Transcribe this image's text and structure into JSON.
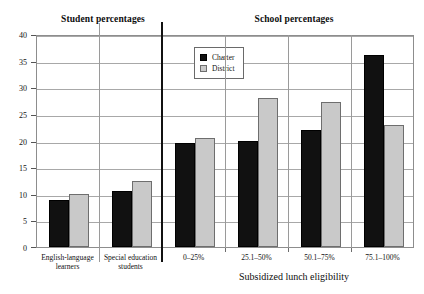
{
  "sections": {
    "student": "Student percentages",
    "school": "School percentages"
  },
  "legend": {
    "charter": "Charter",
    "district": "District"
  },
  "colors": {
    "charter": "#111111",
    "district": "#c9c9c9",
    "grid": "#a8a8a8",
    "frame": "#8d8d8d",
    "divider": "#111111",
    "background": "#ffffff"
  },
  "chart_data": {
    "type": "bar",
    "title": "",
    "subtitle": "",
    "xlabel": "Subsidized lunch eligibility",
    "ylabel": "",
    "ylim": [
      0,
      40
    ],
    "yticks": [
      0,
      5,
      10,
      15,
      20,
      25,
      30,
      35,
      40
    ],
    "ytick_labels": [
      "0",
      "5",
      "10",
      "15",
      "20",
      "25",
      "30",
      "35",
      "40"
    ],
    "grid": true,
    "legend_position": "top-center",
    "categories": [
      "English-language learners",
      "Special education students",
      "0–25%",
      "25.1–50%",
      "50.1–75%",
      "75.1–100%"
    ],
    "category_lines": [
      [
        "English-language",
        "learners"
      ],
      [
        "Special education",
        "students"
      ],
      [
        "0–25%"
      ],
      [
        "25.1–50%"
      ],
      [
        "50.1–75%"
      ],
      [
        "75.1–100%"
      ]
    ],
    "series": [
      {
        "name": "Charter",
        "color": "#111111",
        "values": [
          8.8,
          10.5,
          19.5,
          20.0,
          22.0,
          36.0
        ]
      },
      {
        "name": "District",
        "color": "#c9c9c9",
        "values": [
          10.0,
          12.4,
          20.5,
          28.0,
          27.3,
          23.0
        ]
      }
    ],
    "group_panels": [
      {
        "label": "Student percentages",
        "categories": [
          0,
          1
        ]
      },
      {
        "label": "School percentages",
        "categories": [
          2,
          3,
          4,
          5
        ]
      }
    ]
  }
}
